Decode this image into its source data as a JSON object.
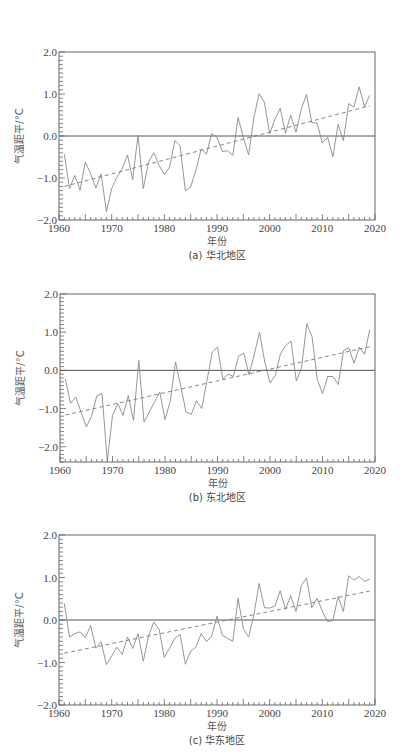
{
  "chart_data": [
    {
      "type": "line",
      "id": "a",
      "caption": "(a) 华北地区",
      "xlabel": "年份",
      "ylabel": "气温距平/°C",
      "xlim": [
        1960,
        2020
      ],
      "ylim": [
        -2.0,
        2.0
      ],
      "xticks": [
        1960,
        1970,
        1980,
        1990,
        2000,
        2010,
        2020
      ],
      "yticks": [
        -2.0,
        -1.0,
        0.0,
        1.0,
        2.0
      ],
      "ytick_labels": [
        "−2.0",
        "−1.0",
        "0.0",
        "1.0",
        "2.0"
      ],
      "grid": false,
      "reference_line": 0.0,
      "x": [
        1961,
        1962,
        1963,
        1964,
        1965,
        1966,
        1967,
        1968,
        1969,
        1970,
        1971,
        1972,
        1973,
        1974,
        1975,
        1976,
        1977,
        1978,
        1979,
        1980,
        1981,
        1982,
        1983,
        1984,
        1985,
        1986,
        1987,
        1988,
        1989,
        1990,
        1991,
        1992,
        1993,
        1994,
        1995,
        1996,
        1997,
        1998,
        1999,
        2000,
        2001,
        2002,
        2003,
        2004,
        2005,
        2006,
        2007,
        2008,
        2009,
        2010,
        2011,
        2012,
        2013,
        2014,
        2015,
        2016,
        2017,
        2018,
        2019
      ],
      "series": [
        {
          "name": "气温距平",
          "style": "solid",
          "values": [
            -0.43,
            -1.25,
            -0.94,
            -1.29,
            -0.62,
            -0.9,
            -1.24,
            -0.9,
            -1.8,
            -1.25,
            -0.98,
            -0.78,
            -0.45,
            -1.04,
            0.02,
            -1.25,
            -0.62,
            -0.4,
            -0.7,
            -0.92,
            -0.74,
            -0.11,
            -0.23,
            -1.31,
            -1.21,
            -0.82,
            -0.31,
            -0.43,
            0.06,
            -0.03,
            -0.37,
            -0.35,
            -0.46,
            0.44,
            -0.03,
            -0.45,
            0.44,
            1.01,
            0.8,
            0.06,
            0.4,
            0.66,
            0.07,
            0.5,
            0.09,
            0.64,
            0.99,
            0.32,
            0.31,
            -0.17,
            -0.03,
            -0.49,
            0.28,
            -0.11,
            0.77,
            0.69,
            1.17,
            0.7,
            0.97
          ]
        },
        {
          "name": "线性趋势",
          "style": "dashed",
          "x": [
            1961,
            2019
          ],
          "values": [
            -1.2,
            0.72
          ]
        }
      ]
    },
    {
      "type": "line",
      "id": "b",
      "caption": "(b) 东北地区",
      "xlabel": "年份",
      "ylabel": "气温距平/°C",
      "xlim": [
        1960,
        2020
      ],
      "ylim": [
        -2.4,
        2.0
      ],
      "xticks": [
        1960,
        1970,
        1980,
        1990,
        2000,
        2010,
        2020
      ],
      "yticks": [
        -2.0,
        -1.0,
        0.0,
        1.0,
        2.0
      ],
      "ytick_labels": [
        "−2.0",
        "−1.0",
        "0.0",
        "1.0",
        "2.0"
      ],
      "grid": false,
      "reference_line": 0.0,
      "x": [
        1961,
        1962,
        1963,
        1964,
        1965,
        1966,
        1967,
        1968,
        1969,
        1970,
        1971,
        1972,
        1973,
        1974,
        1975,
        1976,
        1977,
        1978,
        1979,
        1980,
        1981,
        1982,
        1983,
        1984,
        1985,
        1986,
        1987,
        1988,
        1989,
        1990,
        1991,
        1992,
        1993,
        1994,
        1995,
        1996,
        1997,
        1998,
        1999,
        2000,
        2001,
        2002,
        2003,
        2004,
        2005,
        2006,
        2007,
        2008,
        2009,
        2010,
        2011,
        2012,
        2013,
        2014,
        2015,
        2016,
        2017,
        2018,
        2019
      ],
      "series": [
        {
          "name": "气温距平",
          "style": "solid",
          "values": [
            -0.22,
            -0.86,
            -0.7,
            -1.09,
            -1.48,
            -1.2,
            -0.67,
            -0.61,
            -2.38,
            -1.18,
            -0.87,
            -1.18,
            -0.66,
            -1.31,
            0.26,
            -1.35,
            -1.09,
            -0.83,
            -0.57,
            -1.29,
            -0.8,
            0.22,
            -0.42,
            -1.09,
            -1.15,
            -0.8,
            -1.0,
            -0.26,
            0.48,
            0.61,
            -0.22,
            -0.1,
            -0.16,
            0.37,
            0.45,
            -0.11,
            0.42,
            0.99,
            0.22,
            -0.33,
            -0.13,
            0.44,
            0.65,
            0.77,
            -0.28,
            0.07,
            1.22,
            0.89,
            -0.24,
            -0.61,
            -0.16,
            -0.16,
            -0.37,
            0.52,
            0.59,
            0.19,
            0.61,
            0.42,
            1.07
          ]
        },
        {
          "name": "线性趋势",
          "style": "dashed",
          "x": [
            1961,
            2019
          ],
          "values": [
            -1.17,
            0.62
          ]
        }
      ]
    },
    {
      "type": "line",
      "id": "c",
      "caption": "(c) 华东地区",
      "xlabel": "年份",
      "ylabel": "气温距平/°C",
      "xlim": [
        1960,
        2020
      ],
      "ylim": [
        -2.0,
        2.0
      ],
      "xticks": [
        1960,
        1970,
        1980,
        1990,
        2000,
        2010,
        2020
      ],
      "yticks": [
        -2.0,
        -1.0,
        0.0,
        1.0,
        2.0
      ],
      "ytick_labels": [
        "−2.0",
        "−1.0",
        "0.0",
        "1.0",
        "2.0"
      ],
      "grid": false,
      "reference_line": 0.0,
      "x": [
        1961,
        1962,
        1963,
        1964,
        1965,
        1966,
        1967,
        1968,
        1969,
        1970,
        1971,
        1972,
        1973,
        1974,
        1975,
        1976,
        1977,
        1978,
        1979,
        1980,
        1981,
        1982,
        1983,
        1984,
        1985,
        1986,
        1987,
        1988,
        1989,
        1990,
        1991,
        1992,
        1993,
        1994,
        1995,
        1996,
        1997,
        1998,
        1999,
        2000,
        2001,
        2002,
        2003,
        2004,
        2005,
        2006,
        2007,
        2008,
        2009,
        2010,
        2011,
        2012,
        2013,
        2014,
        2015,
        2016,
        2017,
        2018,
        2019
      ],
      "series": [
        {
          "name": "气温距平",
          "style": "solid",
          "values": [
            0.39,
            -0.4,
            -0.32,
            -0.28,
            -0.42,
            -0.13,
            -0.66,
            -0.51,
            -1.05,
            -0.85,
            -0.64,
            -0.81,
            -0.4,
            -0.67,
            -0.32,
            -0.97,
            -0.38,
            -0.05,
            -0.22,
            -0.88,
            -0.66,
            -0.43,
            -0.34,
            -1.04,
            -0.73,
            -0.64,
            -0.32,
            -0.51,
            -0.38,
            0.09,
            -0.36,
            -0.43,
            -0.5,
            0.51,
            -0.2,
            -0.4,
            0.12,
            0.86,
            0.29,
            0.28,
            0.33,
            0.69,
            0.25,
            0.57,
            0.2,
            0.81,
            0.99,
            0.29,
            0.51,
            0.21,
            -0.04,
            -0.01,
            0.55,
            0.2,
            1.04,
            0.94,
            1.02,
            0.91,
            0.96
          ]
        },
        {
          "name": "线性趋势",
          "style": "dashed",
          "x": [
            1961,
            2019
          ],
          "values": [
            -0.78,
            0.68
          ]
        }
      ]
    }
  ],
  "layout": {
    "panels": [
      {
        "top": 0,
        "height": 264,
        "frame": {
          "left": 59,
          "right": 375,
          "top": 52,
          "bottom": 220
        }
      },
      {
        "top": 264,
        "height": 242,
        "frame": {
          "left": 60,
          "right": 375,
          "top": 30,
          "bottom": 198
        }
      },
      {
        "top": 506,
        "height": 248,
        "frame": {
          "left": 59,
          "right": 375,
          "top": 29,
          "bottom": 199
        }
      }
    ],
    "colors": {
      "axis": "#666666",
      "line": "#8a8a8a",
      "trend": "#7a7a7a",
      "zero": "#555555",
      "text": "#444444"
    }
  }
}
